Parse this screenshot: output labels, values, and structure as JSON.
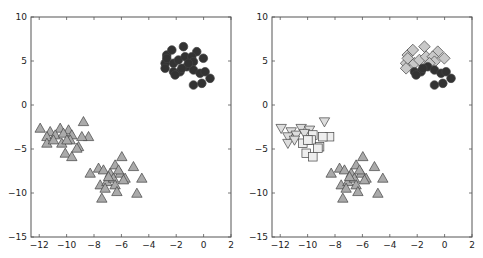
{
  "chart_data": [
    {
      "type": "scatter",
      "title": "",
      "xlabel": "",
      "ylabel": "",
      "xlim": [
        -12.6,
        2
      ],
      "ylim": [
        -15,
        10
      ],
      "xticks": [
        -12,
        -10,
        -8,
        -6,
        -4,
        -2,
        0,
        2
      ],
      "yticks": [
        10,
        5,
        0,
        -5,
        -10,
        -15
      ],
      "grid": false,
      "legend": null,
      "series": [
        {
          "name": "cluster-circles",
          "marker": "circle",
          "color": "#333333",
          "points": [
            [
              -2.69,
              5.68
            ],
            [
              -2.32,
              6.25
            ],
            [
              -1.47,
              6.63
            ],
            [
              -0.5,
              6.06
            ],
            [
              -0.02,
              5.31
            ],
            [
              -2.81,
              4.74
            ],
            [
              -2.81,
              4.17
            ],
            [
              -2.2,
              4.74
            ],
            [
              -1.84,
              5.11
            ],
            [
              -1.35,
              5.49
            ],
            [
              -0.86,
              5.49
            ],
            [
              -0.74,
              4.92
            ],
            [
              -2.2,
              3.78
            ],
            [
              -1.72,
              3.78
            ],
            [
              -1.23,
              4.35
            ],
            [
              -0.74,
              3.98
            ],
            [
              -0.26,
              3.6
            ],
            [
              0.11,
              3.78
            ],
            [
              0.47,
              3.03
            ],
            [
              -0.74,
              2.27
            ],
            [
              -0.13,
              2.46
            ],
            [
              -2.08,
              3.41
            ],
            [
              -1.59,
              4.17
            ],
            [
              -1.11,
              4.74
            ],
            [
              -2.69,
              5.3
            ]
          ]
        },
        {
          "name": "cluster-triangles-left",
          "marker": "triangle-up",
          "color": "#aaaaaa",
          "points": [
            [
              -11.93,
              -2.65
            ],
            [
              -11.2,
              -3.03
            ],
            [
              -10.47,
              -2.65
            ],
            [
              -9.86,
              -2.84
            ],
            [
              -11.44,
              -3.6
            ],
            [
              -10.83,
              -3.41
            ],
            [
              -10.23,
              -3.22
            ],
            [
              -9.62,
              -3.41
            ],
            [
              -8.77,
              -1.9
            ],
            [
              -8.4,
              -3.6
            ],
            [
              -11.44,
              -4.35
            ],
            [
              -10.35,
              -4.35
            ],
            [
              -9.74,
              -3.98
            ],
            [
              -9.13,
              -4.74
            ],
            [
              -10.1,
              -5.49
            ],
            [
              -9.62,
              -5.88
            ],
            [
              -9.25,
              -4.92
            ],
            [
              -8.89,
              -3.6
            ],
            [
              -10.96,
              -3.98
            ],
            [
              -9.98,
              -3.98
            ]
          ]
        },
        {
          "name": "cluster-triangles-bottom",
          "marker": "triangle-up",
          "color": "#aaaaaa",
          "points": [
            [
              -7.67,
              -7.19
            ],
            [
              -8.28,
              -7.76
            ],
            [
              -7.31,
              -7.39
            ],
            [
              -6.82,
              -7.76
            ],
            [
              -6.46,
              -6.82
            ],
            [
              -5.97,
              -5.88
            ],
            [
              -5.12,
              -7.01
            ],
            [
              -4.51,
              -8.33
            ],
            [
              -7.55,
              -9.09
            ],
            [
              -7.06,
              -8.72
            ],
            [
              -6.58,
              -8.33
            ],
            [
              -6.09,
              -7.76
            ],
            [
              -5.73,
              -8.33
            ],
            [
              -7.19,
              -9.47
            ],
            [
              -6.46,
              -9.09
            ],
            [
              -5.85,
              -8.52
            ],
            [
              -6.33,
              -9.85
            ],
            [
              -7.43,
              -10.6
            ],
            [
              -4.87,
              -10.04
            ],
            [
              -6.94,
              -8.15
            ],
            [
              -6.21,
              -7.39
            ]
          ]
        }
      ]
    },
    {
      "type": "scatter",
      "title": "",
      "xlabel": "",
      "ylabel": "",
      "xlim": [
        -12.6,
        2
      ],
      "ylim": [
        -15,
        10
      ],
      "xticks": [
        -12,
        -10,
        -8,
        -6,
        -4,
        -2,
        0,
        2
      ],
      "yticks": [
        10,
        5,
        0,
        -5,
        -10,
        -15
      ],
      "grid": false,
      "legend": null,
      "series": [
        {
          "name": "diamonds",
          "marker": "diamond",
          "color": "#c8c8c8",
          "points": [
            [
              -2.69,
              5.68
            ],
            [
              -2.32,
              6.25
            ],
            [
              -1.47,
              6.63
            ],
            [
              -0.5,
              6.06
            ],
            [
              -0.02,
              5.31
            ],
            [
              -2.81,
              4.74
            ],
            [
              -2.81,
              4.17
            ],
            [
              -2.2,
              4.74
            ],
            [
              -1.84,
              5.11
            ],
            [
              -1.35,
              5.49
            ],
            [
              -0.86,
              5.49
            ],
            [
              -0.74,
              4.92
            ],
            [
              -1.11,
              4.74
            ],
            [
              -2.69,
              5.3
            ]
          ]
        },
        {
          "name": "circles",
          "marker": "circle",
          "color": "#333333",
          "points": [
            [
              -2.2,
              3.78
            ],
            [
              -1.72,
              3.78
            ],
            [
              -1.23,
              4.35
            ],
            [
              -0.74,
              3.98
            ],
            [
              -0.26,
              3.6
            ],
            [
              0.11,
              3.78
            ],
            [
              0.47,
              3.03
            ],
            [
              -0.74,
              2.27
            ],
            [
              -0.13,
              2.46
            ],
            [
              -2.08,
              3.41
            ],
            [
              -1.59,
              4.17
            ]
          ]
        },
        {
          "name": "triangles-down",
          "marker": "triangle-down",
          "color": "#dddddd",
          "points": [
            [
              -11.93,
              -2.65
            ],
            [
              -11.2,
              -3.03
            ],
            [
              -10.47,
              -2.65
            ],
            [
              -9.86,
              -2.84
            ],
            [
              -11.44,
              -3.6
            ],
            [
              -10.83,
              -3.41
            ],
            [
              -10.23,
              -3.22
            ],
            [
              -8.77,
              -1.9
            ],
            [
              -11.44,
              -4.35
            ],
            [
              -10.96,
              -3.98
            ]
          ]
        },
        {
          "name": "squares",
          "marker": "square",
          "color": "#eeeeee",
          "points": [
            [
              -9.62,
              -3.41
            ],
            [
              -8.4,
              -3.6
            ],
            [
              -10.35,
              -4.35
            ],
            [
              -9.74,
              -3.98
            ],
            [
              -9.13,
              -4.74
            ],
            [
              -10.1,
              -5.49
            ],
            [
              -9.62,
              -5.88
            ],
            [
              -9.25,
              -4.92
            ],
            [
              -8.89,
              -3.6
            ],
            [
              -9.98,
              -3.98
            ]
          ]
        },
        {
          "name": "triangles-up",
          "marker": "triangle-up",
          "color": "#aaaaaa",
          "points": [
            [
              -7.67,
              -7.19
            ],
            [
              -8.28,
              -7.76
            ],
            [
              -7.31,
              -7.39
            ],
            [
              -6.82,
              -7.76
            ],
            [
              -6.46,
              -6.82
            ],
            [
              -5.97,
              -5.88
            ],
            [
              -5.12,
              -7.01
            ],
            [
              -4.51,
              -8.33
            ],
            [
              -7.55,
              -9.09
            ],
            [
              -7.06,
              -8.72
            ],
            [
              -6.58,
              -8.33
            ],
            [
              -6.09,
              -7.76
            ],
            [
              -5.73,
              -8.33
            ],
            [
              -7.19,
              -9.47
            ],
            [
              -6.46,
              -9.09
            ],
            [
              -5.85,
              -8.52
            ],
            [
              -6.33,
              -9.85
            ],
            [
              -7.43,
              -10.6
            ],
            [
              -4.87,
              -10.04
            ],
            [
              -6.94,
              -8.15
            ],
            [
              -6.21,
              -7.39
            ]
          ]
        }
      ]
    }
  ],
  "panels": [
    {
      "x": 31,
      "y": 17,
      "w": 200,
      "h": 220
    },
    {
      "x": 272,
      "y": 17,
      "w": 200,
      "h": 220
    }
  ]
}
